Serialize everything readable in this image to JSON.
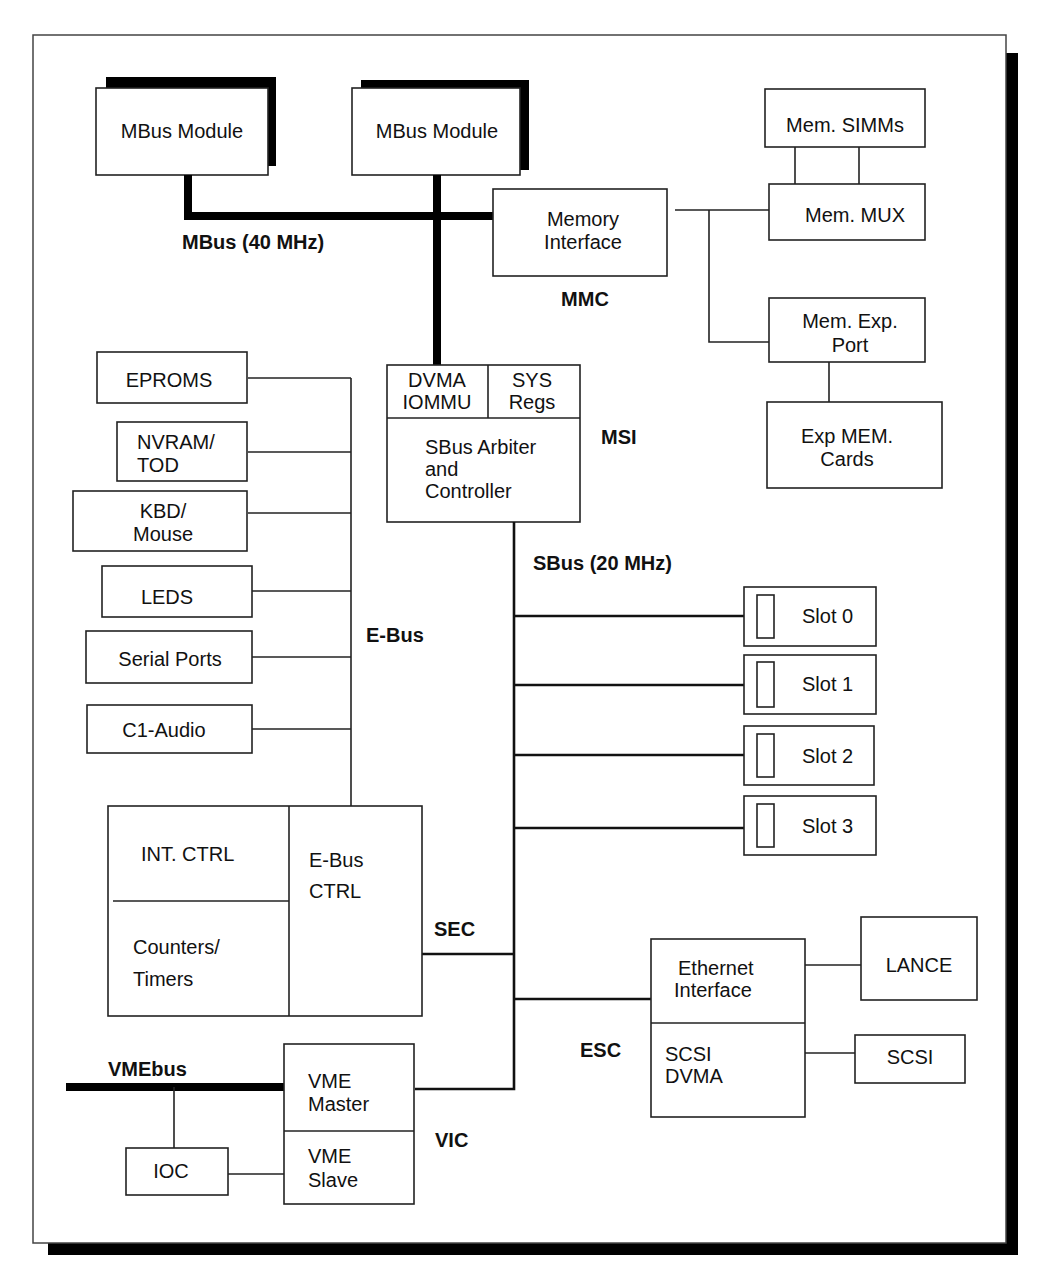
{
  "diagram": {
    "buses": {
      "mbus": "MBus (40 MHz)",
      "sbus": "SBus (20 MHz)",
      "ebus": "E-Bus",
      "vmebus": "VMEbus"
    },
    "chip_labels": {
      "mmc": "MMC",
      "msi": "MSI",
      "sec": "SEC",
      "esc": "ESC",
      "vic": "VIC"
    },
    "mbus_modules": [
      {
        "label": "MBus Module"
      },
      {
        "label": "MBus Module"
      }
    ],
    "memory": {
      "interface": [
        "Memory",
        "Interface"
      ],
      "simms": "Mem. SIMMs",
      "mux": "Mem. MUX",
      "exp_port": [
        "Mem. Exp.",
        "Port"
      ],
      "exp_cards": [
        "Exp MEM.",
        "Cards"
      ]
    },
    "msi_block": {
      "dvma": [
        "DVMA",
        "IOMMU"
      ],
      "sys": [
        "SYS",
        "Regs"
      ],
      "arbiter": [
        "SBus Arbiter",
        "and",
        "Controller"
      ]
    },
    "ebus_devices": [
      {
        "lines": [
          "EPROMS"
        ]
      },
      {
        "lines": [
          "NVRAM/",
          "TOD"
        ]
      },
      {
        "lines": [
          "KBD/",
          "Mouse"
        ]
      },
      {
        "lines": [
          "LEDS"
        ]
      },
      {
        "lines": [
          "Serial Ports"
        ]
      },
      {
        "lines": [
          "C1-Audio"
        ]
      }
    ],
    "sec_block": {
      "int_ctrl": "INT. CTRL",
      "counters": [
        "Counters/",
        "Timers"
      ],
      "ebus_ctrl": [
        "E-Bus",
        "CTRL"
      ]
    },
    "slots": [
      {
        "label": "Slot 0"
      },
      {
        "label": "Slot 1"
      },
      {
        "label": "Slot 2"
      },
      {
        "label": "Slot 3"
      }
    ],
    "esc_block": {
      "ethernet": [
        "Ethernet",
        "Interface"
      ],
      "scsi_dvma": [
        "SCSI",
        "DVMA"
      ],
      "lance": "LANCE",
      "scsi": "SCSI"
    },
    "vic_block": {
      "master": [
        "VME",
        "Master"
      ],
      "slave": [
        "VME",
        "Slave"
      ],
      "ioc": "IOC"
    }
  }
}
